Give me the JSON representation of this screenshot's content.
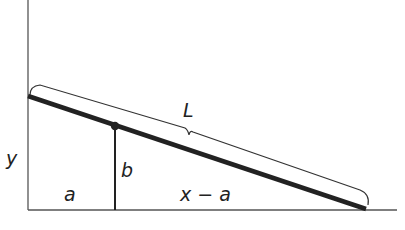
{
  "diagram": {
    "labels": {
      "y": "y",
      "a": "a",
      "b": "b",
      "x_minus_a": "x − a",
      "L": "L"
    },
    "colors": {
      "line": "#222222",
      "axis": "#555555",
      "background": "#ffffff"
    }
  }
}
